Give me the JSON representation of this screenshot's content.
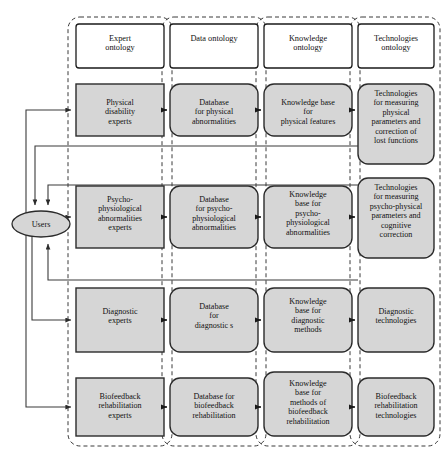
{
  "diagram": {
    "actor": {
      "label": "Users",
      "shape": "ellipse"
    },
    "colors": {
      "node_fill": "#d6d6d6",
      "node_stroke": "#2b2b2b",
      "header_fill": "#ffffff",
      "frame_stroke": "#3a3a3a",
      "arrow": "#1a1a1a",
      "background": "#ffffff"
    },
    "columns": [
      {
        "id": "expert",
        "header": "Expert\nontology"
      },
      {
        "id": "data",
        "header": "Data ontology"
      },
      {
        "id": "knowledge",
        "header": "Knowledge\nontology"
      },
      {
        "id": "technologies",
        "header": "Technologies\nontology"
      }
    ],
    "rows": [
      {
        "id": "physical",
        "cells": [
          "Physical\ndisability\nexperts",
          "Database\nfor physical\nabnormalities",
          "Knowledge base\nfor\nphysical features",
          "Technologies\nfor measuring\nphysical\nparameters and\ncorrection of\nlost functions"
        ]
      },
      {
        "id": "psycho",
        "cells": [
          "Psycho-\nphysiological\nabnormalities\nexperts",
          "Database\nfor psycho-\nphysiological\nabnormalities",
          "Knowledge\nbase for\npsycho-\nphysiological\nabnormalities",
          "Technologies\nfor measuring\npsycho-physical\nparameters and\ncognitive\ncorrection"
        ]
      },
      {
        "id": "diagnostic",
        "cells": [
          "Diagnostic\nexperts",
          "Database\nfor\ndiagnostic s",
          "Knowledge\nbase for\ndiagnostic\nmethods",
          "Diagnostic\ntechnologies"
        ]
      },
      {
        "id": "biofeedback",
        "cells": [
          "Biofeedback\nrehabilitation\nexperts",
          "Database for\nbiofeedback\nrehabilitation",
          "Knowledge\nbase for\nmethods of\nbiofeedback\nrehabilitation",
          "Biofeedback\nrehabilitation\ntechnologies"
        ]
      }
    ],
    "flows": {
      "forward_description": "Users feeds each expert node; each row flows left to right across the four ontology columns.",
      "feedback_description": "Each technologies-column node returns a feedback line back to the Users ellipse."
    }
  }
}
